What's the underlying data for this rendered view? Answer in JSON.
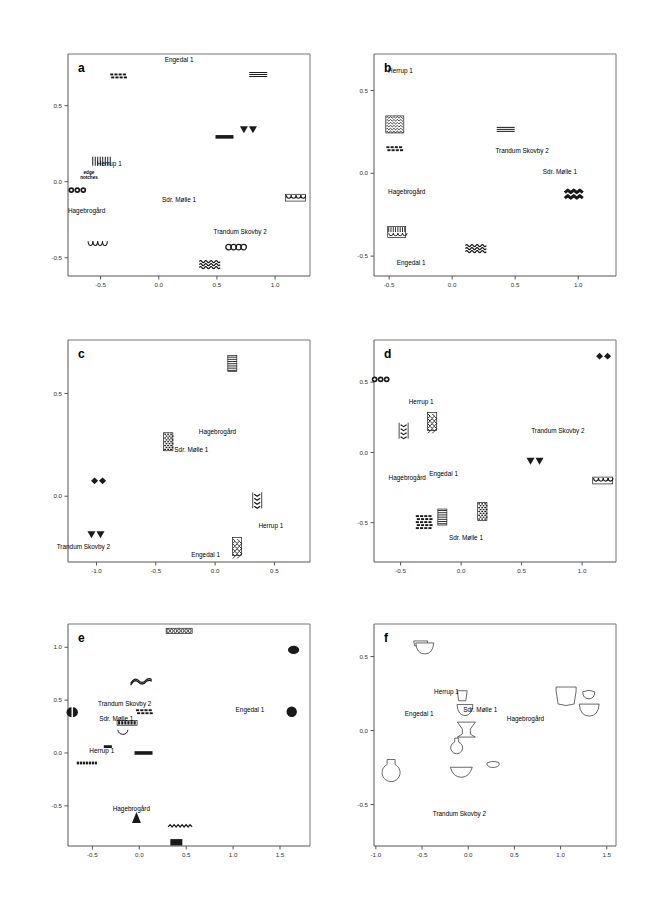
{
  "figure": {
    "panel_count": 6,
    "caption": ""
  },
  "sites": [
    "Engedal 1",
    "Herrup 1",
    "Sdr. Mølle 1",
    "Trandum Skovby 2",
    "Hagebrogård"
  ],
  "notes": {
    "edge_notches_line1": "edge",
    "edge_notches_line2": "notches"
  },
  "chart_data": [
    {
      "type": "scatter",
      "panel": "a",
      "title": "a",
      "xlabel": "",
      "ylabel": "",
      "xlim": [
        -0.78,
        1.3
      ],
      "ylim": [
        -0.62,
        0.84
      ],
      "xticks": [
        -0.5,
        0.0,
        0.5,
        1.0
      ],
      "xticklabels": [
        "-0.5",
        "0.0",
        "0.5",
        "1.0"
      ],
      "yticks": [
        0.5,
        0.0,
        -0.5
      ],
      "yticklabels": [
        "0.5",
        "0.0",
        "-0.5"
      ],
      "grid": false,
      "legend": "none",
      "markers": [
        {
          "name": "checkerboard-stamp",
          "x": -0.345,
          "y": 0.692
        },
        {
          "name": "horizontal-lines-thin",
          "x": 0.855,
          "y": 0.705
        },
        {
          "name": "filled-triangles-pair",
          "x": 0.775,
          "y": 0.345
        },
        {
          "name": "solid-bar",
          "x": 0.565,
          "y": 0.295
        },
        {
          "name": "vertical-strokes",
          "x": -0.49,
          "y": 0.135
        },
        {
          "name": "small-circles-row",
          "x": -0.7,
          "y": -0.055
        },
        {
          "name": "scalloped-arcs",
          "x": 1.175,
          "y": -0.105
        },
        {
          "name": "hanging-arcs",
          "x": -0.53,
          "y": -0.415
        },
        {
          "name": "circle-chain",
          "x": 0.665,
          "y": -0.43
        },
        {
          "name": "wave-lines",
          "x": 0.435,
          "y": -0.545
        }
      ],
      "annotations": [
        {
          "text": "Engedal 1",
          "x": 0.175,
          "y": 0.79
        },
        {
          "text": "Herrup 1",
          "x": -0.425,
          "y": 0.105
        },
        {
          "text": "edge",
          "x": -0.6,
          "y": 0.05
        },
        {
          "text": "notches",
          "x": -0.6,
          "y": 0.015
        },
        {
          "text": "Sdr. Mølle 1",
          "x": 0.175,
          "y": -0.135
        },
        {
          "text": "Hagebrogård",
          "x": -0.62,
          "y": -0.205
        },
        {
          "text": "Trandum Skovby 2",
          "x": 0.7,
          "y": -0.345
        }
      ]
    },
    {
      "type": "scatter",
      "panel": "b",
      "title": "b",
      "xlabel": "",
      "ylabel": "",
      "xlim": [
        -0.62,
        1.3
      ],
      "ylim": [
        -0.62,
        0.72
      ],
      "xticks": [
        -0.5,
        0.0,
        0.5,
        1.0
      ],
      "xticklabels": [
        "-0.5",
        "0.0",
        "0.5",
        "1.0"
      ],
      "yticks": [
        0.5,
        0.0,
        -0.5
      ],
      "yticklabels": [
        "0.5",
        "0.0",
        "-0.5"
      ],
      "grid": false,
      "legend": "none",
      "markers": [
        {
          "name": "wavy-band-block",
          "x": -0.455,
          "y": 0.295
        },
        {
          "name": "horizontal-lines-thin",
          "x": 0.425,
          "y": 0.265
        },
        {
          "name": "checkerboard-stamp",
          "x": -0.455,
          "y": 0.145
        },
        {
          "name": "bold-zigzag",
          "x": 0.965,
          "y": -0.135
        },
        {
          "name": "grid-hatch-block",
          "x": -0.44,
          "y": -0.355
        },
        {
          "name": "wave-lines",
          "x": 0.185,
          "y": -0.455
        }
      ],
      "annotations": [
        {
          "text": "Herrup 1",
          "x": -0.41,
          "y": 0.605
        },
        {
          "text": "Trandum Skovby 2",
          "x": 0.555,
          "y": 0.125
        },
        {
          "text": "Sdr. Mølle 1",
          "x": 0.855,
          "y": -0.005
        },
        {
          "text": "Hagebrogård",
          "x": -0.36,
          "y": -0.125
        },
        {
          "text": "Engedal 1",
          "x": -0.325,
          "y": -0.555
        }
      ]
    },
    {
      "type": "scatter",
      "panel": "c",
      "title": "c",
      "xlabel": "",
      "ylabel": "",
      "xlim": [
        -1.24,
        0.8
      ],
      "ylim": [
        -0.32,
        0.76
      ],
      "xticks": [
        -1.0,
        -0.5,
        0.0,
        0.5
      ],
      "xticklabels": [
        "-1.0",
        "-0.5",
        "0.0",
        "0.5"
      ],
      "yticks": [
        0.5,
        0.0
      ],
      "yticklabels": [
        "0.5",
        "0.0"
      ],
      "grid": false,
      "legend": "none",
      "markers": [
        {
          "name": "horizontal-lines-block",
          "x": 0.145,
          "y": 0.645
        },
        {
          "name": "dense-hatch-block",
          "x": -0.395,
          "y": 0.265
        },
        {
          "name": "filled-diamonds-pair",
          "x": -0.995,
          "y": 0.075
        },
        {
          "name": "vertical-dashes",
          "x": 0.355,
          "y": -0.02
        },
        {
          "name": "filled-triangles-pair",
          "x": -1.0,
          "y": -0.185
        },
        {
          "name": "scale-hatch-block",
          "x": 0.185,
          "y": -0.245
        }
      ],
      "annotations": [
        {
          "text": "Hagebrogård",
          "x": 0.02,
          "y": 0.305
        },
        {
          "text": "Sdr. Mølle 1",
          "x": -0.2,
          "y": 0.215
        },
        {
          "text": "Herrup 1",
          "x": 0.47,
          "y": -0.155
        },
        {
          "text": "Trandum Skovby 2",
          "x": -1.11,
          "y": -0.255
        },
        {
          "text": "Engedal 1",
          "x": -0.08,
          "y": -0.295
        }
      ]
    },
    {
      "type": "scatter",
      "panel": "d",
      "title": "d",
      "xlabel": "",
      "ylabel": "",
      "xlim": [
        -0.72,
        1.28
      ],
      "ylim": [
        -0.78,
        0.8
      ],
      "xticks": [
        -0.5,
        0.0,
        0.5,
        1.0
      ],
      "xticklabels": [
        "-0.5",
        "0.0",
        "0.5",
        "1.0"
      ],
      "yticks": [
        0.5,
        0.0,
        -0.5
      ],
      "yticklabels": [
        "0.5",
        "0.0",
        "-0.5"
      ],
      "grid": false,
      "legend": "none",
      "markers": [
        {
          "name": "filled-diamonds-pair",
          "x": 1.165,
          "y": 0.685
        },
        {
          "name": "small-circles-row",
          "x": -0.665,
          "y": 0.52
        },
        {
          "name": "scale-hatch-block",
          "x": -0.24,
          "y": 0.22
        },
        {
          "name": "vertical-dashes",
          "x": -0.475,
          "y": 0.155
        },
        {
          "name": "filled-triangles-pair",
          "x": 0.615,
          "y": -0.06
        },
        {
          "name": "scalloped-arcs",
          "x": 1.17,
          "y": -0.2
        },
        {
          "name": "dense-hatch-block",
          "x": 0.175,
          "y": -0.42
        },
        {
          "name": "horizontal-lines-block",
          "x": -0.155,
          "y": -0.46
        },
        {
          "name": "checkerboard-stamp-block",
          "x": -0.305,
          "y": -0.5
        }
      ],
      "annotations": [
        {
          "text": "Herrup 1",
          "x": -0.33,
          "y": 0.345
        },
        {
          "text": "Trandum Skovby 2",
          "x": 0.8,
          "y": 0.135
        },
        {
          "text": "Hagebrogård",
          "x": -0.445,
          "y": -0.195
        },
        {
          "text": "Engedal 1",
          "x": -0.145,
          "y": -0.165
        },
        {
          "text": "Sdr. Mølle 1",
          "x": 0.04,
          "y": -0.625
        }
      ]
    },
    {
      "type": "scatter",
      "panel": "e",
      "title": "e",
      "xlabel": "",
      "ylabel": "",
      "xlim": [
        -0.76,
        1.82
      ],
      "ylim": [
        -0.88,
        1.22
      ],
      "xticks": [
        -0.5,
        0.0,
        0.5,
        1.0,
        1.5
      ],
      "xticklabels": [
        "-0.5",
        "0.0",
        "0.5",
        "1.0",
        "1.5"
      ],
      "yticks": [
        1.0,
        0.5,
        0.0,
        -0.5
      ],
      "yticklabels": [
        "1.0",
        "0.5",
        "0.0",
        "-0.5"
      ],
      "grid": false,
      "legend": "none",
      "markers": [
        {
          "name": "pellet-row",
          "x": 0.425,
          "y": 1.155
        },
        {
          "name": "filled-ellipse",
          "x": 1.645,
          "y": 0.975
        },
        {
          "name": "wavy-cord",
          "x": 0.025,
          "y": 0.675
        },
        {
          "name": "half-circle-pair",
          "x": -0.715,
          "y": 0.385
        },
        {
          "name": "checkerboard-stamp-small",
          "x": 0.055,
          "y": 0.385
        },
        {
          "name": "filled-circle",
          "x": 1.625,
          "y": 0.39
        },
        {
          "name": "bead-row",
          "x": -0.13,
          "y": 0.285
        },
        {
          "name": "arc-stroke",
          "x": -0.175,
          "y": 0.2
        },
        {
          "name": "short-bar",
          "x": -0.335,
          "y": 0.06
        },
        {
          "name": "solid-bar",
          "x": 0.045,
          "y": 0.0
        },
        {
          "name": "dotted-bar",
          "x": -0.56,
          "y": -0.095
        },
        {
          "name": "filled-triangle",
          "x": -0.03,
          "y": -0.615
        },
        {
          "name": "zigzag-line",
          "x": 0.435,
          "y": -0.7
        },
        {
          "name": "solid-rectangle",
          "x": 0.395,
          "y": -0.845
        }
      ],
      "annotations": [
        {
          "text": "Trandum Skovby 2",
          "x": -0.155,
          "y": 0.445
        },
        {
          "text": "Engedal 1",
          "x": 1.18,
          "y": 0.385
        },
        {
          "text": "Sdr. Mølle 1",
          "x": -0.245,
          "y": 0.3
        },
        {
          "text": "Herrup 1",
          "x": -0.4,
          "y": 0.0
        },
        {
          "text": "Hagebrogård",
          "x": -0.085,
          "y": -0.545
        }
      ]
    },
    {
      "type": "scatter",
      "panel": "f",
      "title": "f",
      "xlabel": "",
      "ylabel": "",
      "xlim": [
        -1.02,
        1.6
      ],
      "ylim": [
        -0.78,
        0.72
      ],
      "xticks": [
        -1.0,
        -0.5,
        0.0,
        0.5,
        1.0,
        1.5
      ],
      "xticklabels": [
        "-1.0",
        "-0.5",
        "0.0",
        "0.5",
        "1.0",
        "1.5"
      ],
      "yticks": [
        0.5,
        0.0,
        -0.5
      ],
      "yticklabels": [
        "0.5",
        "0.0",
        "-0.5"
      ],
      "grid": false,
      "legend": "none",
      "markers": [
        {
          "name": "bowl-pair-outline",
          "x": -0.46,
          "y": 0.565
        },
        {
          "name": "small-cup-outline",
          "x": -0.065,
          "y": 0.235
        },
        {
          "name": "large-beaker-outline",
          "x": 1.06,
          "y": 0.22
        },
        {
          "name": "small-bowl-outline",
          "x": 1.305,
          "y": 0.235
        },
        {
          "name": "footed-bowl-outline",
          "x": -0.035,
          "y": 0.135
        },
        {
          "name": "wide-bowl-outline",
          "x": 1.31,
          "y": 0.145
        },
        {
          "name": "pedestal-vessel-outline",
          "x": -0.02,
          "y": 0.01
        },
        {
          "name": "flask-outline",
          "x": -0.125,
          "y": -0.105
        },
        {
          "name": "globular-jar-outline",
          "x": -0.835,
          "y": -0.27
        },
        {
          "name": "lid-outline",
          "x": 0.265,
          "y": -0.235
        },
        {
          "name": "shallow-dish-outline",
          "x": -0.075,
          "y": -0.275
        }
      ],
      "annotations": [
        {
          "text": "Herrup 1",
          "x": -0.235,
          "y": 0.245
        },
        {
          "text": "Sdr. Mølle 1",
          "x": 0.13,
          "y": 0.125
        },
        {
          "text": "Engedal 1",
          "x": -0.53,
          "y": 0.1
        },
        {
          "text": "Hagebrogård",
          "x": 0.62,
          "y": 0.065
        },
        {
          "text": "Trandum Skovby 2",
          "x": -0.095,
          "y": -0.58
        }
      ]
    }
  ]
}
